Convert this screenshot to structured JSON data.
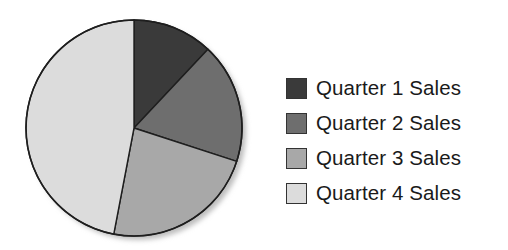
{
  "chart_data": {
    "type": "pie",
    "title": "",
    "categories": [
      "Quarter 1 Sales",
      "Quarter 2 Sales",
      "Quarter 3 Sales",
      "Quarter 4 Sales"
    ],
    "values": [
      12,
      18,
      23,
      47
    ],
    "colors": [
      "#3a3a3a",
      "#6e6e6e",
      "#a8a8a8",
      "#dcdcdc"
    ],
    "start_angle": "top (12 o'clock), clockwise",
    "legend_position": "right"
  },
  "legend": {
    "items": [
      {
        "label": "Quarter 1 Sales",
        "color": "#3a3a3a"
      },
      {
        "label": "Quarter 2 Sales",
        "color": "#6e6e6e"
      },
      {
        "label": "Quarter 3 Sales",
        "color": "#a8a8a8"
      },
      {
        "label": "Quarter 4 Sales",
        "color": "#dcdcdc"
      }
    ]
  }
}
